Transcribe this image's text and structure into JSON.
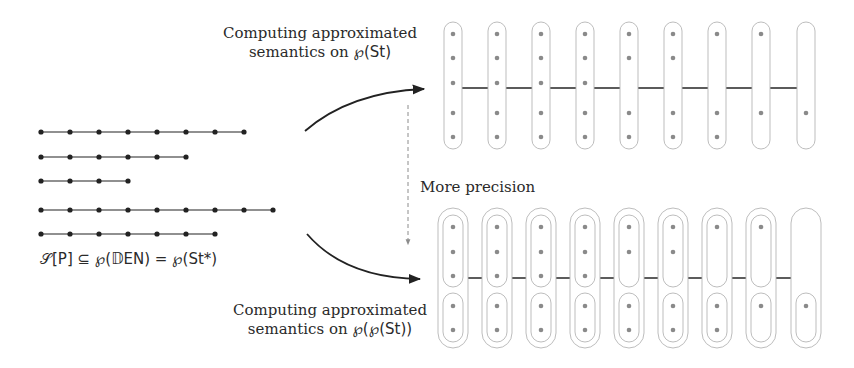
{
  "labels": {
    "top": {
      "line1": "Computing approximated",
      "line2_prefix": "semantics on ",
      "line2_math": "℘(St)"
    },
    "bottom": {
      "line1": "Computing approximated",
      "line2_prefix": "semantics on ",
      "line2_math": "℘(℘(St))"
    },
    "precision": "More precision",
    "set": "𝒮[P] ⊆ ℘(𝔻EN) = ℘(St*)"
  },
  "colors": {
    "ink": "#222222",
    "dot_gray": "#8a8a8a",
    "pill_stroke": "#b5b5b5",
    "dashed": "#8c8c8c"
  },
  "traces": [
    {
      "length": 8
    },
    {
      "length": 6
    },
    {
      "length": 4
    },
    {
      "length": 9
    },
    {
      "length": 7
    }
  ],
  "top_abstraction": {
    "columns": [
      {
        "dots": [
          1,
          2,
          3,
          4,
          5
        ]
      },
      {
        "dots": [
          1,
          2,
          3,
          4,
          5
        ]
      },
      {
        "dots": [
          1,
          2,
          3,
          4,
          5
        ]
      },
      {
        "dots": [
          1,
          2,
          3,
          4,
          5
        ]
      },
      {
        "dots": [
          1,
          2,
          4,
          5
        ]
      },
      {
        "dots": [
          1,
          2,
          4,
          5
        ]
      },
      {
        "dots": [
          1,
          4,
          5
        ]
      },
      {
        "dots": [
          1,
          4
        ]
      },
      {
        "dots": [
          4
        ]
      }
    ]
  },
  "bottom_abstraction": {
    "columns": [
      {
        "top": [
          1,
          2,
          3
        ],
        "bottom": [
          4,
          5
        ]
      },
      {
        "top": [
          1,
          2,
          3
        ],
        "bottom": [
          4,
          5
        ]
      },
      {
        "top": [
          1,
          2,
          3
        ],
        "bottom": [
          4,
          5
        ]
      },
      {
        "top": [
          1,
          2,
          3
        ],
        "bottom": [
          4,
          5
        ]
      },
      {
        "top": [
          1,
          2
        ],
        "bottom": [
          4,
          5
        ]
      },
      {
        "top": [
          1,
          2
        ],
        "bottom": [
          4,
          5
        ]
      },
      {
        "top": [
          1
        ],
        "bottom": [
          4,
          5
        ]
      },
      {
        "top": [
          1
        ],
        "bottom": [
          4
        ]
      },
      {
        "top": [],
        "bottom": [
          4
        ]
      }
    ]
  }
}
